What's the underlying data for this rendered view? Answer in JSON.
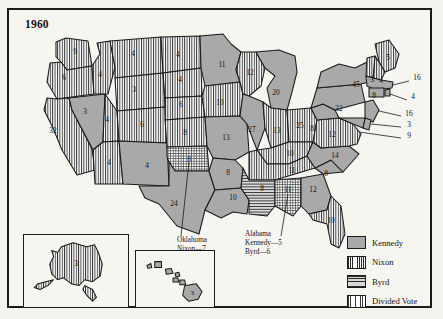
{
  "title": "1960",
  "legend": {
    "items": [
      {
        "key": "kennedy",
        "label": "Kennedy",
        "color": "#a9a9a9",
        "pattern": "solid"
      },
      {
        "key": "nixon",
        "label": "Nixon",
        "color": "#ffffff",
        "pattern": "vertical-stripes"
      },
      {
        "key": "byrd",
        "label": "Byrd",
        "color": "#d8d8d8",
        "pattern": "horizontal-stripes"
      },
      {
        "key": "divided",
        "label": "Divided Vote",
        "color": "#ffffff",
        "pattern": "grid-hatch"
      }
    ]
  },
  "callouts": [
    {
      "name": "oklahoma",
      "lines": [
        "Oklahoma",
        "Nixon—7",
        "Byrd—1"
      ]
    },
    {
      "name": "alabama",
      "lines": [
        "Alabama",
        "Kennedy—5",
        "Byrd—6"
      ]
    }
  ],
  "insets": [
    {
      "name": "alaska",
      "label": "3",
      "party": "nixon"
    },
    {
      "name": "hawaii",
      "label": "3",
      "party": "kennedy"
    }
  ],
  "chart_data": {
    "type": "map",
    "title": "1960",
    "categories": [
      "Kennedy",
      "Nixon",
      "Byrd",
      "Divided Vote"
    ],
    "states": [
      {
        "code": "WA",
        "name": "Washington",
        "votes": 9,
        "party": "nixon",
        "x": 66,
        "y": 44
      },
      {
        "code": "OR",
        "name": "Oregon",
        "votes": 6,
        "party": "nixon",
        "x": 55,
        "y": 70
      },
      {
        "code": "CA",
        "name": "California",
        "votes": 32,
        "party": "nixon",
        "x": 44,
        "y": 123
      },
      {
        "code": "NV",
        "name": "Nevada",
        "votes": 3,
        "party": "kennedy",
        "x": 76,
        "y": 104
      },
      {
        "code": "ID",
        "name": "Idaho",
        "votes": 4,
        "party": "nixon",
        "x": 91,
        "y": 67
      },
      {
        "code": "MT",
        "name": "Montana",
        "votes": 4,
        "party": "nixon",
        "x": 124,
        "y": 46
      },
      {
        "code": "WY",
        "name": "Wyoming",
        "votes": 3,
        "party": "nixon",
        "x": 125,
        "y": 82
      },
      {
        "code": "UT",
        "name": "Utah",
        "votes": 4,
        "party": "nixon",
        "x": 98,
        "y": 112
      },
      {
        "code": "CO",
        "name": "Colorado",
        "votes": 6,
        "party": "nixon",
        "x": 133,
        "y": 117
      },
      {
        "code": "AZ",
        "name": "Arizona",
        "votes": 4,
        "party": "nixon",
        "x": 100,
        "y": 155
      },
      {
        "code": "NM",
        "name": "New Mexico",
        "votes": 4,
        "party": "kennedy",
        "x": 138,
        "y": 158
      },
      {
        "code": "ND",
        "name": "North Dakota",
        "votes": 4,
        "party": "nixon",
        "x": 169,
        "y": 47
      },
      {
        "code": "SD",
        "name": "South Dakota",
        "votes": 4,
        "party": "nixon",
        "x": 171,
        "y": 72
      },
      {
        "code": "NE",
        "name": "Nebraska",
        "votes": 6,
        "party": "nixon",
        "x": 172,
        "y": 97
      },
      {
        "code": "KS",
        "name": "Kansas",
        "votes": 8,
        "party": "nixon",
        "x": 176,
        "y": 125
      },
      {
        "code": "OK",
        "name": "Oklahoma",
        "votes": 8,
        "party": "divided",
        "x": 180,
        "y": 152
      },
      {
        "code": "TX",
        "name": "Texas",
        "votes": 24,
        "party": "kennedy",
        "x": 165,
        "y": 196
      },
      {
        "code": "MN",
        "name": "Minnesota",
        "votes": 11,
        "party": "kennedy",
        "x": 213,
        "y": 57
      },
      {
        "code": "IA",
        "name": "Iowa",
        "votes": 10,
        "party": "nixon",
        "x": 211,
        "y": 95
      },
      {
        "code": "MO",
        "name": "Missouri",
        "votes": 13,
        "party": "kennedy",
        "x": 217,
        "y": 130
      },
      {
        "code": "AR",
        "name": "Arkansas",
        "votes": 8,
        "party": "kennedy",
        "x": 219,
        "y": 165
      },
      {
        "code": "LA",
        "name": "Louisiana",
        "votes": 10,
        "party": "kennedy",
        "x": 224,
        "y": 190
      },
      {
        "code": "WI",
        "name": "Wisconsin",
        "votes": 12,
        "party": "nixon",
        "x": 241,
        "y": 65
      },
      {
        "code": "IL",
        "name": "Illinois",
        "votes": 27,
        "party": "kennedy",
        "x": 243,
        "y": 122
      },
      {
        "code": "MI",
        "name": "Michigan",
        "votes": 20,
        "party": "kennedy",
        "x": 267,
        "y": 85
      },
      {
        "code": "IN",
        "name": "Indiana",
        "votes": 13,
        "party": "nixon",
        "x": 268,
        "y": 123
      },
      {
        "code": "OH",
        "name": "Ohio",
        "votes": 25,
        "party": "nixon",
        "x": 291,
        "y": 118
      },
      {
        "code": "KY",
        "name": "Kentucky",
        "votes": 10,
        "party": "nixon",
        "x": 281,
        "y": 146
      },
      {
        "code": "TN",
        "name": "Tennessee",
        "votes": 11,
        "party": "nixon",
        "x": 283,
        "y": 163
      },
      {
        "code": "MS",
        "name": "Mississippi",
        "votes": 8,
        "party": "byrd",
        "x": 253,
        "y": 181
      },
      {
        "code": "AL",
        "name": "Alabama",
        "votes": 11,
        "party": "divided",
        "x": 279,
        "y": 182
      },
      {
        "code": "GA",
        "name": "Georgia",
        "votes": 12,
        "party": "kennedy",
        "x": 304,
        "y": 182
      },
      {
        "code": "FL",
        "name": "Florida",
        "votes": 10,
        "party": "nixon",
        "x": 322,
        "y": 213
      },
      {
        "code": "SC",
        "name": "South Carolina",
        "votes": 8,
        "party": "kennedy",
        "x": 317,
        "y": 166
      },
      {
        "code": "NC",
        "name": "North Carolina",
        "votes": 14,
        "party": "kennedy",
        "x": 326,
        "y": 148
      },
      {
        "code": "VA",
        "name": "Virginia",
        "votes": 12,
        "party": "nixon",
        "x": 323,
        "y": 127
      },
      {
        "code": "WV",
        "name": "West Virginia",
        "votes": 8,
        "party": "kennedy",
        "x": 303,
        "y": 121
      },
      {
        "code": "PA",
        "name": "Pennsylvania",
        "votes": 32,
        "party": "kennedy",
        "x": 330,
        "y": 101
      },
      {
        "code": "NY",
        "name": "New York",
        "votes": 45,
        "party": "kennedy",
        "x": 347,
        "y": 77
      },
      {
        "code": "ME",
        "name": "Maine",
        "votes": 5,
        "party": "nixon",
        "x": 379,
        "y": 50
      },
      {
        "code": "VT",
        "name": "Vermont",
        "votes": 3,
        "party": "nixon",
        "x": 363,
        "y": 72
      },
      {
        "code": "NH",
        "name": "New Hampshire",
        "votes": 4,
        "party": "nixon",
        "x": 372,
        "y": 73
      },
      {
        "code": "MA",
        "name": "Massachusetts",
        "votes": 16,
        "party": "kennedy",
        "x": 408,
        "y": 70
      },
      {
        "code": "RI",
        "name": "Rhode Island",
        "votes": 4,
        "party": "kennedy",
        "x": 404,
        "y": 89
      },
      {
        "code": "CT",
        "name": "Connecticut",
        "votes": 8,
        "party": "kennedy",
        "x": 365,
        "y": 88
      },
      {
        "code": "NJ",
        "name": "New Jersey",
        "votes": 16,
        "party": "kennedy",
        "x": 400,
        "y": 106
      },
      {
        "code": "DE",
        "name": "Delaware",
        "votes": 3,
        "party": "kennedy",
        "x": 400,
        "y": 117
      },
      {
        "code": "MD",
        "name": "Maryland",
        "votes": 9,
        "party": "kennedy",
        "x": 400,
        "y": 128
      },
      {
        "code": "AK",
        "name": "Alaska",
        "votes": 3,
        "party": "nixon",
        "x": 0,
        "y": 0
      },
      {
        "code": "HI",
        "name": "Hawaii",
        "votes": 3,
        "party": "kennedy",
        "x": 0,
        "y": 0
      }
    ]
  }
}
